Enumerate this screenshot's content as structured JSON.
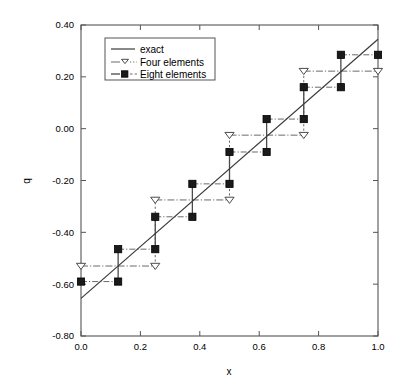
{
  "chart_data": {
    "type": "line",
    "title": "",
    "subtitle": "",
    "xlabel": "x",
    "ylabel": "q",
    "xlim": [
      0.0,
      1.0
    ],
    "ylim": [
      -0.8,
      0.4
    ],
    "xticks": [
      "0.0",
      "0.2",
      "0.4",
      "0.6",
      "0.8",
      "1.0"
    ],
    "xtick_values": [
      0.0,
      0.2,
      0.4,
      0.6,
      0.8,
      1.0
    ],
    "yticks": [
      "0.40",
      "0.20",
      "0.00",
      "-0.20",
      "-0.40",
      "-0.60",
      "-0.80"
    ],
    "ytick_values": [
      0.4,
      0.2,
      0.0,
      -0.2,
      -0.4,
      -0.6,
      -0.8
    ],
    "grid": false,
    "legend_position": "upper left",
    "series": [
      {
        "name": "exact",
        "style": "solid-line",
        "marker": "none",
        "x": [
          0.0,
          1.0
        ],
        "values": [
          -0.655,
          0.345
        ]
      },
      {
        "name": "Four elements",
        "style": "dash-dot-line",
        "marker": "open-triangle-down",
        "segments": [
          {
            "x0": 0.0,
            "x1": 0.25,
            "y": -0.53
          },
          {
            "x0": 0.25,
            "x1": 0.5,
            "y": -0.275
          },
          {
            "x0": 0.5,
            "x1": 0.75,
            "y": -0.025
          },
          {
            "x0": 0.75,
            "x1": 1.0,
            "y": 0.222
          }
        ],
        "marker_points": [
          {
            "x": 0.0,
            "y": -0.53
          },
          {
            "x": 0.25,
            "y": -0.53
          },
          {
            "x": 0.25,
            "y": -0.275
          },
          {
            "x": 0.5,
            "y": -0.275
          },
          {
            "x": 0.5,
            "y": -0.025
          },
          {
            "x": 0.75,
            "y": -0.025
          },
          {
            "x": 0.75,
            "y": 0.222
          },
          {
            "x": 1.0,
            "y": 0.222
          }
        ]
      },
      {
        "name": "Eight elements",
        "style": "dash-dot-line",
        "marker": "filled-square",
        "segments": [
          {
            "x0": 0.0,
            "x1": 0.125,
            "y": -0.59
          },
          {
            "x0": 0.125,
            "x1": 0.25,
            "y": -0.465
          },
          {
            "x0": 0.25,
            "x1": 0.375,
            "y": -0.34
          },
          {
            "x0": 0.375,
            "x1": 0.5,
            "y": -0.213
          },
          {
            "x0": 0.5,
            "x1": 0.625,
            "y": -0.09
          },
          {
            "x0": 0.625,
            "x1": 0.75,
            "y": 0.037
          },
          {
            "x0": 0.75,
            "x1": 0.875,
            "y": 0.16
          },
          {
            "x0": 0.875,
            "x1": 1.0,
            "y": 0.285
          }
        ],
        "marker_points": [
          {
            "x": 0.0,
            "y": -0.59
          },
          {
            "x": 0.125,
            "y": -0.59
          },
          {
            "x": 0.125,
            "y": -0.465
          },
          {
            "x": 0.25,
            "y": -0.465
          },
          {
            "x": 0.25,
            "y": -0.34
          },
          {
            "x": 0.375,
            "y": -0.34
          },
          {
            "x": 0.375,
            "y": -0.213
          },
          {
            "x": 0.5,
            "y": -0.213
          },
          {
            "x": 0.5,
            "y": -0.09
          },
          {
            "x": 0.625,
            "y": -0.09
          },
          {
            "x": 0.625,
            "y": 0.037
          },
          {
            "x": 0.75,
            "y": 0.037
          },
          {
            "x": 0.75,
            "y": 0.16
          },
          {
            "x": 0.875,
            "y": 0.16
          },
          {
            "x": 0.875,
            "y": 0.285
          },
          {
            "x": 1.0,
            "y": 0.285
          }
        ]
      }
    ]
  },
  "legend": {
    "entries": [
      {
        "label": "exact"
      },
      {
        "label": "Four elements"
      },
      {
        "label": "Eight elements"
      }
    ]
  },
  "colors": {
    "background": "#ffffff",
    "frame": "#555555",
    "exact": "#3a3a3a",
    "four_elements": "#6a6a6a",
    "eight_elements": "#1a1a1a",
    "text": "#000000"
  }
}
